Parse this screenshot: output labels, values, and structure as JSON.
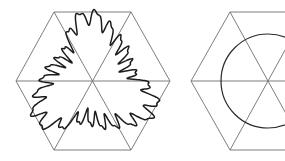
{
  "figure": {
    "title": "",
    "background_color": "#ffffff",
    "width": 285,
    "height": 161,
    "style": {
      "hexagon_stroke_color": "#6e6e6e",
      "hexagon_stroke_width": 0.9,
      "diagonal_stroke_color": "#6e6e6e",
      "diagonal_stroke_width": 0.9,
      "curve_stroke_color": "#1c1c1c",
      "curve_stroke_width": 1.5,
      "circle_stroke_color": "#2a2a2a",
      "circle_stroke_width": 1.2
    },
    "panels": [
      {
        "name": "left-panel",
        "label": "hexagon-with-wavy-curve",
        "hexagon": {
          "center_x": 93,
          "center_y": 81,
          "circumradius": 77,
          "orientation": "pointy-left-right",
          "vertices": [
            [
              16,
              81
            ],
            [
              54,
              12
            ],
            [
              131,
              12
            ],
            [
              170,
              81
            ],
            [
              131,
              150
            ],
            [
              54,
              150
            ]
          ],
          "diagonals": [
            [
              [
                16,
                81
              ],
              [
                170,
                81
              ]
            ],
            [
              [
                54,
                12
              ],
              [
                131,
                150
              ]
            ],
            [
              [
                131,
                12
              ],
              [
                54,
                150
              ]
            ]
          ]
        },
        "inner_shape": {
          "type": "wavy-closed-curve",
          "symmetry_order": 3,
          "undulation_count": 24,
          "mean_radius": 50,
          "amplitude": 7
        }
      },
      {
        "name": "right-panel",
        "label": "hexagon-with-circle",
        "clipped_at_right_edge": true,
        "hexagon": {
          "center_x": 268,
          "center_y": 81,
          "circumradius": 77,
          "orientation": "pointy-left-right",
          "vertices": [
            [
              191,
              81
            ],
            [
              230,
              12
            ],
            [
              306,
              12
            ],
            [
              345,
              81
            ],
            [
              306,
              150
            ],
            [
              230,
              150
            ]
          ],
          "diagonals": [
            [
              [
                191,
                81
              ],
              [
                345,
                81
              ]
            ],
            [
              [
                230,
                12
              ],
              [
                306,
                150
              ]
            ],
            [
              [
                306,
                12
              ],
              [
                230,
                150
              ]
            ]
          ]
        },
        "inner_shape": {
          "type": "circle",
          "center_x": 268,
          "center_y": 81,
          "radius": 47
        }
      }
    ]
  }
}
